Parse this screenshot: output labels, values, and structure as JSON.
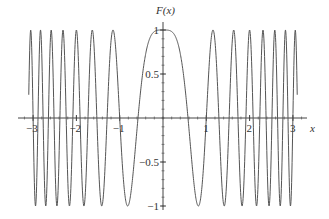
{
  "chart_data": {
    "type": "line",
    "title": "",
    "function_label": "F(x)",
    "expression": "cos(3*pi*x^2/2)",
    "xlabel": "x",
    "ylabel": "F(x)",
    "xlim": [
      -3.35,
      3.3
    ],
    "ylim": [
      -1,
      1
    ],
    "x_ticks": [
      -3,
      -2,
      -1,
      1,
      2,
      3
    ],
    "x_tick_labels": [
      "−3",
      "−2",
      "−1",
      "1",
      "2",
      "3"
    ],
    "y_ticks": [
      -1,
      -0.5,
      0.5,
      1
    ],
    "y_tick_labels": [
      "−1",
      "−0.5",
      "0.5",
      "1"
    ],
    "minor_tick_step_x": 0.2,
    "minor_tick_step_y": 0.1,
    "grid": false,
    "legend": null,
    "series": [
      {
        "name": "F(x)",
        "x_range": [
          -3.1,
          3.1
        ],
        "samples": 1200,
        "color": "#555555"
      }
    ]
  },
  "axes": {
    "origin_px": [
      163,
      118
    ],
    "x_unit_px": 43.3,
    "y_unit_px": 88,
    "x_axis_px": [
      18,
      307
    ],
    "y_axis_px": [
      22,
      210
    ]
  }
}
